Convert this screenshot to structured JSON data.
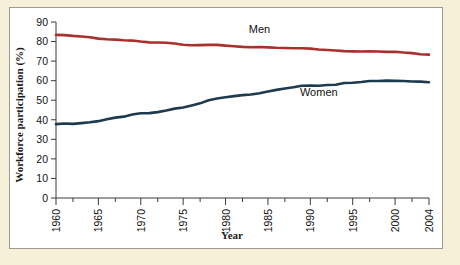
{
  "figure": {
    "background_color": "#f7f0d8",
    "panel_color": "#ffffff",
    "border_color": "#9a9a92"
  },
  "chart_data": {
    "type": "line",
    "title": "",
    "xlabel": "Year",
    "ylabel": "Workforce participation (%)",
    "xlim": [
      1960,
      2004
    ],
    "ylim": [
      0,
      90
    ],
    "grid": false,
    "legend": "inline-labels",
    "x_ticks": [
      1960,
      1965,
      1970,
      1975,
      1980,
      1985,
      1990,
      1995,
      2000,
      2004
    ],
    "x_tick_labels": [
      "1960",
      "1965",
      "1970",
      "1975",
      "1980",
      "1985",
      "1990",
      "1995",
      "2000",
      "2004"
    ],
    "x_minor_ticks": [
      1962,
      1967,
      1972,
      1977,
      1982,
      1987,
      1992,
      1997,
      2002
    ],
    "y_ticks": [
      0,
      10,
      20,
      30,
      40,
      50,
      60,
      70,
      80,
      90
    ],
    "y_tick_labels": [
      "0",
      "10",
      "20",
      "30",
      "40",
      "50",
      "60",
      "70",
      "80",
      "90"
    ],
    "x": [
      1960,
      1961,
      1962,
      1963,
      1964,
      1965,
      1966,
      1967,
      1968,
      1969,
      1970,
      1971,
      1972,
      1973,
      1974,
      1975,
      1976,
      1977,
      1978,
      1979,
      1980,
      1981,
      1982,
      1983,
      1984,
      1985,
      1986,
      1987,
      1988,
      1989,
      1990,
      1991,
      1992,
      1993,
      1994,
      1995,
      1996,
      1997,
      1998,
      1999,
      2000,
      2001,
      2002,
      2003,
      2004
    ],
    "series": [
      {
        "name": "Men",
        "color": "#a8312e",
        "label_text": "Men",
        "label_x": 1984,
        "label_y": 84.5,
        "values": [
          83.4,
          83.3,
          82.9,
          82.6,
          82.2,
          81.5,
          81.2,
          81.0,
          80.7,
          80.5,
          80.0,
          79.6,
          79.5,
          79.4,
          79.0,
          78.4,
          78.1,
          78.2,
          78.3,
          78.3,
          77.9,
          77.6,
          77.3,
          77.1,
          77.2,
          77.0,
          76.8,
          76.7,
          76.6,
          76.6,
          76.4,
          75.9,
          75.7,
          75.4,
          75.1,
          75.0,
          74.9,
          75.0,
          74.9,
          74.7,
          74.8,
          74.4,
          74.1,
          73.5,
          73.3
        ]
      },
      {
        "name": "Women",
        "color": "#1d3a4f",
        "label_text": "Women",
        "label_x": 1991,
        "label_y": 52.0,
        "values": [
          37.8,
          38.1,
          37.9,
          38.3,
          38.7,
          39.3,
          40.3,
          41.1,
          41.6,
          42.7,
          43.3,
          43.4,
          43.9,
          44.7,
          45.7,
          46.3,
          47.3,
          48.4,
          50.0,
          50.9,
          51.5,
          52.1,
          52.6,
          52.9,
          53.6,
          54.5,
          55.3,
          56.0,
          56.6,
          57.4,
          57.5,
          57.4,
          57.8,
          57.9,
          58.8,
          58.9,
          59.3,
          59.8,
          59.8,
          60.0,
          59.9,
          59.8,
          59.6,
          59.5,
          59.2
        ]
      }
    ]
  }
}
